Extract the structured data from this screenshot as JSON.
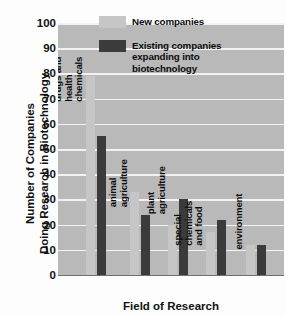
{
  "chart_data": {
    "type": "bar",
    "title": "",
    "xlabel": "Field of Research",
    "ylabel": "Number of Companies\nDoing Research in Biotechnology",
    "ylabel_line1": "Number of Companies",
    "ylabel_line2": "Doing Research in Biotechnology",
    "ylim": [
      0,
      100
    ],
    "yticks": [
      0,
      10,
      20,
      30,
      40,
      50,
      60,
      70,
      80,
      90,
      100
    ],
    "grid": true,
    "legend_position": "top-right",
    "categories": [
      "drugs and\nhealth\nchemicals",
      "animal\nagriculture",
      "plant\nagriculture",
      "special\nchemicals\nand food",
      "environment"
    ],
    "series": [
      {
        "name": "New companies",
        "color": "#c6c6c6",
        "values": [
          79,
          33,
          20,
          17,
          12
        ]
      },
      {
        "name": "Existing companies expanding into biotechnology",
        "color": "#3b3b3b",
        "values": [
          55,
          24,
          30,
          22,
          12
        ]
      }
    ]
  },
  "legend": {
    "entries": [
      {
        "label": "New companies",
        "swatch": "new"
      },
      {
        "label": "Existing companies\nexpanding into\nbiotechnology",
        "swatch": "existing"
      }
    ]
  },
  "colors": {
    "plot_background": "#b9b9b9",
    "gridline": "#f2f2f2",
    "new_companies": "#c6c6c6",
    "existing_companies": "#3b3b3b",
    "text": "#111111"
  }
}
